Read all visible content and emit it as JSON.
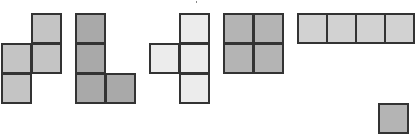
{
  "diagram": {
    "title": "",
    "cell_size": 30,
    "border_color": "#333333",
    "pieces": [
      {
        "name": "S-tetromino",
        "color": "#c4c4c4",
        "cells": [
          [
            31,
            13
          ],
          [
            1,
            43
          ],
          [
            31,
            43
          ],
          [
            1,
            73
          ]
        ]
      },
      {
        "name": "L-tetromino",
        "color": "#a9a9a9",
        "cells": [
          [
            75,
            13
          ],
          [
            75,
            43
          ],
          [
            75,
            73
          ],
          [
            105,
            73
          ]
        ]
      },
      {
        "name": "T-tetromino",
        "color": "#ececec",
        "cells": [
          [
            179,
            13
          ],
          [
            149,
            43
          ],
          [
            179,
            43
          ],
          [
            179,
            73
          ]
        ]
      },
      {
        "name": "O-tetromino",
        "color": "#b4b4b4",
        "cells": [
          [
            223,
            13
          ],
          [
            253,
            13
          ],
          [
            223,
            43
          ],
          [
            253,
            43
          ]
        ]
      },
      {
        "name": "I-tetromino",
        "color": "#d2d2d2",
        "cells": [
          [
            297,
            13
          ],
          [
            326,
            13
          ],
          [
            355,
            13
          ],
          [
            384,
            13
          ]
        ]
      },
      {
        "name": "partial-piece",
        "color": "#b4b4b4",
        "cells": [
          [
            378,
            103
          ]
        ]
      }
    ]
  }
}
